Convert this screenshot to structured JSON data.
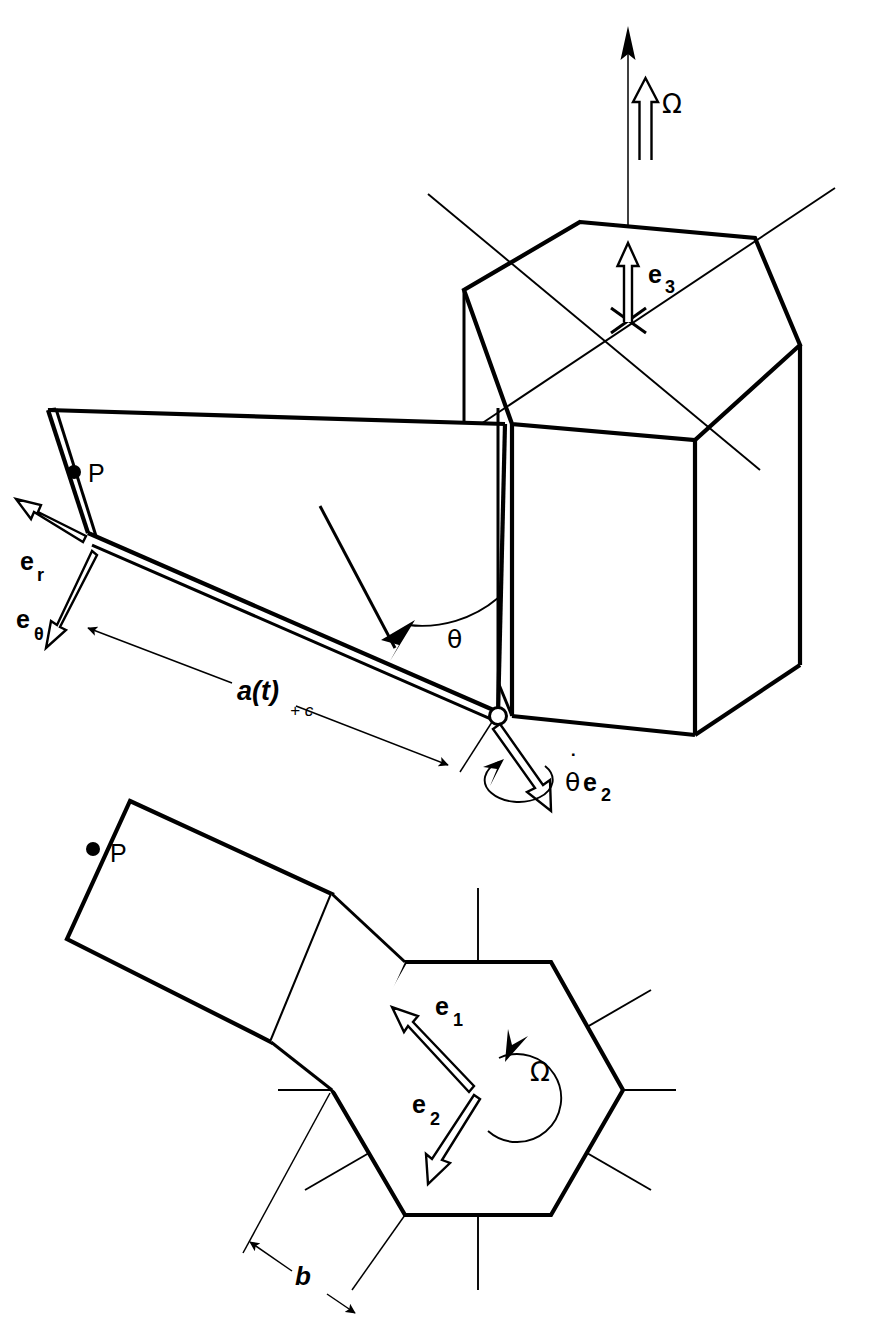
{
  "figure": {
    "kind": "engineering-line-diagram",
    "background_color": "#ffffff",
    "line_color": "#000000"
  },
  "views": {
    "top_view": {
      "name": "perspective-view",
      "labels": {
        "omega": "Ω",
        "e3": "e",
        "e3_sub": "3",
        "point_p": "P",
        "er": "e",
        "er_sub": "r",
        "etheta": "e",
        "etheta_sub": "θ",
        "theta": "θ",
        "length_a": "a(t)",
        "length_a_sub": "+ c",
        "theta_dot_e2_dot": "˙",
        "theta_dot_e2_theta": "θ",
        "theta_dot_e2_e": "e",
        "theta_dot_e2_sub": "2"
      }
    },
    "bottom_view": {
      "name": "plan-view",
      "labels": {
        "point_p": "P",
        "e1": "e",
        "e1_sub": "1",
        "e2": "e",
        "e2_sub": "2",
        "omega": "Ω",
        "width_b": "b"
      }
    }
  },
  "annotations": {
    "spin_axis_vector": "Ω",
    "body_unit_vectors": [
      "e1",
      "e2",
      "e3"
    ],
    "polar_unit_vectors": [
      "er",
      "eθ"
    ],
    "hinge_angle": "θ",
    "hinge_rate_vector": "θ̇e2",
    "panel_length": "a(t) + c",
    "hexagon_side": "b",
    "material_point": "P"
  }
}
